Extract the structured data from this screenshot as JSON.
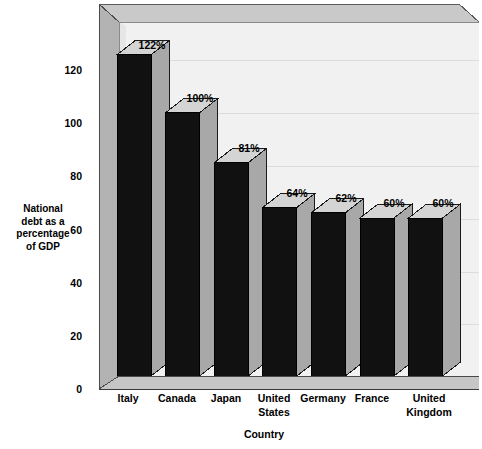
{
  "chart_data": {
    "type": "bar",
    "title": "",
    "subtitle": "",
    "xlabel": "Country",
    "ylabel": "National\ndebt as a\npercentage\nof  GDP",
    "categories": [
      "Italy",
      "Canada",
      "Japan",
      "United States",
      "Germany",
      "France",
      "United Kingdom"
    ],
    "values": [
      122,
      100,
      81,
      64,
      62,
      60,
      60
    ],
    "value_labels": [
      "122%",
      "100%",
      "81%",
      "64%",
      "62%",
      "60%",
      "60%"
    ],
    "ylim": [
      0,
      140
    ],
    "yticks": [
      0,
      20,
      40,
      60,
      80,
      100,
      120
    ],
    "ytick_labels": [
      "0",
      "20",
      "40",
      "60",
      "80",
      "100",
      "120"
    ],
    "grid": true,
    "legend": false,
    "style": "3d-column",
    "colors": {
      "bar_front": "#111111",
      "bar_top": "#d4d4d4",
      "bar_side": "#a8a8a8",
      "plot_background": "#f0f0f0",
      "wall": "#b4b4b4",
      "floor": "#c0c0c0",
      "text": "#000000",
      "gridline": "#d8d8d8",
      "outline": "#000000"
    }
  },
  "axes": {
    "y_title_lines": [
      "National",
      "debt as a",
      "percentage",
      "of  GDP"
    ],
    "y_ticks": [
      {
        "label": "120",
        "value": 120
      },
      {
        "label": "100",
        "value": 100
      },
      {
        "label": "80",
        "value": 80
      },
      {
        "label": "60",
        "value": 60
      },
      {
        "label": "40",
        "value": 40
      },
      {
        "label": "20",
        "value": 20
      },
      {
        "label": "0",
        "value": 0
      }
    ],
    "x_title": "Country",
    "x_ticks": [
      {
        "line1": "Italy",
        "line2": ""
      },
      {
        "line1": "Canada",
        "line2": ""
      },
      {
        "line1": "Japan",
        "line2": ""
      },
      {
        "line1": "United",
        "line2": "States"
      },
      {
        "line1": "Germany",
        "line2": ""
      },
      {
        "line1": "France",
        "line2": ""
      },
      {
        "line1": "United",
        "line2": "Kingdom"
      }
    ]
  },
  "bars": [
    {
      "country": "Italy",
      "value": 122,
      "label": "122%"
    },
    {
      "country": "Canada",
      "value": 100,
      "label": "100%"
    },
    {
      "country": "Japan",
      "value": 81,
      "label": "81%"
    },
    {
      "country": "United States",
      "value": 64,
      "label": "64%"
    },
    {
      "country": "Germany",
      "value": 62,
      "label": "62%"
    },
    {
      "country": "France",
      "value": 60,
      "label": "60%"
    },
    {
      "country": "United Kingdom",
      "value": 60,
      "label": "60%"
    }
  ]
}
